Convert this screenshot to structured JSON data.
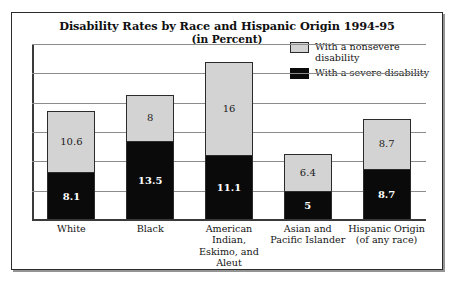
{
  "chart_data": {
    "type": "bar",
    "subtype": "stacked-bar",
    "title": "Disability Rates by Race and Hispanic Origin 1994-95",
    "subtitle": "(in Percent)",
    "xlabel": "",
    "ylabel": "",
    "ylim": [
      0,
      30
    ],
    "grid": true,
    "gridlines": [
      5,
      10,
      15,
      20,
      25,
      30
    ],
    "axis_tick_labels_shown": false,
    "legend_position": "top-right",
    "categories": [
      "White",
      "Black",
      "American Indian, Eskimo, and Aleut",
      "Asian and Pacific Islander",
      "Hispanic Origin (of any race)"
    ],
    "category_label_lines": [
      [
        "White"
      ],
      [
        "Black"
      ],
      [
        "American",
        "Indian,",
        "Eskimo, and",
        "Aleut"
      ],
      [
        "Asian and",
        "Pacific Islander"
      ],
      [
        "Hispanic Origin",
        "(of any race)"
      ]
    ],
    "series": [
      {
        "name": "With a severe disability",
        "color": "#0a0a0a",
        "values": [
          8.1,
          13.5,
          11.1,
          5,
          8.7
        ],
        "value_labels": [
          "8.1",
          "13.5",
          "11.1",
          "5",
          "8.7"
        ]
      },
      {
        "name": "With a nonsevere disability",
        "color": "#d3d3d3",
        "values": [
          10.6,
          8,
          16,
          6.4,
          8.7
        ],
        "value_labels": [
          "10.6",
          "8",
          "16",
          "6.4",
          "8.7"
        ]
      }
    ],
    "totals": [
      18.7,
      21.5,
      27.1,
      11.4,
      17.4
    ]
  },
  "legend": {
    "items": [
      {
        "label": "With a nonsevere disability",
        "swatch": "nonsevere"
      },
      {
        "label": "With a severe disability",
        "swatch": "severe"
      }
    ]
  },
  "colors": {
    "nonsevere": "#d3d3d3",
    "severe": "#0a0a0a",
    "frame": "#2b2b2b",
    "gridline": "#8c8c8c",
    "background": "#ffffff"
  }
}
